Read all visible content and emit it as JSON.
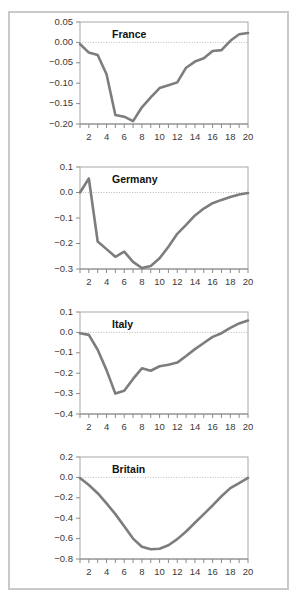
{
  "figure": {
    "background_color": "#ffffff",
    "frame_color": "#c9c9c9",
    "line_color": "#7d7d7d",
    "axis_color": "#8a8a8a",
    "zero_line_color": "#b9b9b9",
    "panel_count": 4
  },
  "chart_data": [
    {
      "type": "line",
      "title": "France",
      "xlabel": "",
      "ylabel": "",
      "xlim": [
        1,
        20
      ],
      "ylim": [
        -0.2,
        0.05
      ],
      "grid": false,
      "legend": "none",
      "zero_reference_line": 0.0,
      "ytick_labels": [
        "0.05",
        "0.00",
        "-0.05",
        "-0.10",
        "-0.15",
        "-0.20"
      ],
      "ytick_values": [
        0.05,
        0.0,
        -0.05,
        -0.1,
        -0.15,
        -0.2
      ],
      "xtick_labels": [
        "2",
        "4",
        "6",
        "8",
        "10",
        "12",
        "14",
        "16",
        "18",
        "20"
      ],
      "xtick_values": [
        2,
        4,
        6,
        8,
        10,
        12,
        14,
        16,
        18,
        20
      ],
      "x": [
        1,
        2,
        3,
        4,
        5,
        6,
        7,
        8,
        9,
        10,
        11,
        12,
        13,
        14,
        15,
        16,
        17,
        18,
        19,
        20
      ],
      "values": [
        -0.004,
        -0.025,
        -0.031,
        -0.078,
        -0.178,
        -0.182,
        -0.193,
        -0.159,
        -0.135,
        -0.112,
        -0.105,
        -0.098,
        -0.062,
        -0.047,
        -0.039,
        -0.021,
        -0.019,
        0.004,
        0.02,
        0.023
      ]
    },
    {
      "type": "line",
      "title": "Germany",
      "xlabel": "",
      "ylabel": "",
      "xlim": [
        1,
        20
      ],
      "ylim": [
        -0.3,
        0.1
      ],
      "grid": false,
      "legend": "none",
      "zero_reference_line": 0.0,
      "ytick_labels": [
        "0.1",
        "0.0",
        "-0.1",
        "-0.2",
        "-0.3"
      ],
      "ytick_values": [
        0.1,
        0.0,
        -0.1,
        -0.2,
        -0.3
      ],
      "xtick_labels": [
        "2",
        "4",
        "6",
        "8",
        "10",
        "12",
        "14",
        "16",
        "18",
        "20"
      ],
      "xtick_values": [
        2,
        4,
        6,
        8,
        10,
        12,
        14,
        16,
        18,
        20
      ],
      "x": [
        1,
        2,
        3,
        4,
        5,
        6,
        7,
        8,
        9,
        10,
        11,
        12,
        13,
        14,
        15,
        16,
        17,
        18,
        19,
        20
      ],
      "values": [
        0.0,
        0.055,
        -0.192,
        -0.222,
        -0.252,
        -0.232,
        -0.272,
        -0.296,
        -0.288,
        -0.258,
        -0.213,
        -0.162,
        -0.127,
        -0.09,
        -0.063,
        -0.042,
        -0.029,
        -0.018,
        -0.008,
        -0.002
      ]
    },
    {
      "type": "line",
      "title": "Italy",
      "xlabel": "",
      "ylabel": "",
      "xlim": [
        1,
        20
      ],
      "ylim": [
        -0.4,
        0.1
      ],
      "grid": false,
      "legend": "none",
      "zero_reference_line": 0.0,
      "ytick_labels": [
        "0.1",
        "0.0",
        "-0.1",
        "-0.2",
        "-0.3",
        "-0.4"
      ],
      "ytick_values": [
        0.1,
        0.0,
        -0.1,
        -0.2,
        -0.3,
        -0.4
      ],
      "xtick_labels": [
        "2",
        "4",
        "6",
        "8",
        "10",
        "12",
        "14",
        "16",
        "18",
        "20"
      ],
      "xtick_values": [
        2,
        4,
        6,
        8,
        10,
        12,
        14,
        16,
        18,
        20
      ],
      "x": [
        1,
        2,
        3,
        4,
        5,
        6,
        7,
        8,
        9,
        10,
        11,
        12,
        13,
        14,
        15,
        16,
        17,
        18,
        19,
        20
      ],
      "values": [
        -0.004,
        -0.012,
        -0.085,
        -0.185,
        -0.3,
        -0.286,
        -0.228,
        -0.176,
        -0.188,
        -0.166,
        -0.159,
        -0.148,
        -0.116,
        -0.082,
        -0.052,
        -0.022,
        -0.004,
        0.022,
        0.044,
        0.058
      ]
    },
    {
      "type": "line",
      "title": "Britain",
      "xlabel": "",
      "ylabel": "",
      "xlim": [
        1,
        20
      ],
      "ylim": [
        -0.8,
        0.2
      ],
      "grid": false,
      "legend": "none",
      "zero_reference_line": 0.0,
      "ytick_labels": [
        "0.2",
        "0.0",
        "-0.2",
        "-0.4",
        "-0.6",
        "-0.8"
      ],
      "ytick_values": [
        0.2,
        0.0,
        -0.2,
        -0.4,
        -0.6,
        -0.8
      ],
      "xtick_labels": [
        "2",
        "4",
        "6",
        "8",
        "10",
        "12",
        "14",
        "16",
        "18",
        "20"
      ],
      "xtick_values": [
        2,
        4,
        6,
        8,
        10,
        12,
        14,
        16,
        18,
        20
      ],
      "x": [
        1,
        2,
        3,
        4,
        5,
        6,
        7,
        8,
        9,
        10,
        11,
        12,
        13,
        14,
        15,
        16,
        17,
        18,
        19,
        20
      ],
      "values": [
        -0.006,
        -0.075,
        -0.155,
        -0.255,
        -0.36,
        -0.48,
        -0.6,
        -0.68,
        -0.705,
        -0.7,
        -0.665,
        -0.605,
        -0.53,
        -0.445,
        -0.36,
        -0.275,
        -0.185,
        -0.105,
        -0.055,
        -0.004
      ]
    }
  ]
}
